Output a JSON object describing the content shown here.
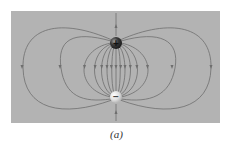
{
  "figure": {
    "caption": "(a)",
    "panel_color": "#b3b3b3",
    "line_color": "#6e6e6e",
    "charges": [
      {
        "sign": "+",
        "label": "+",
        "x": 116,
        "y": 43,
        "color": "#3a3a3a"
      },
      {
        "sign": "-",
        "label": "−",
        "x": 116,
        "y": 97,
        "color": "#e8e8e8"
      }
    ],
    "arrow_direction": "positive-to-negative"
  }
}
